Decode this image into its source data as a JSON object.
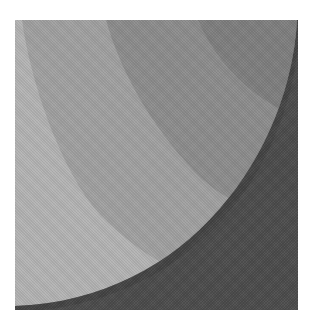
{
  "artwork": {
    "subject": "abstract concentric arcs",
    "colors": {
      "background": "#ffffff",
      "band_lightest": "#b3b3b3",
      "band_light": "#a0a0a0",
      "band_middle": "#8c8c8c",
      "band_inner": "#7e7e7e",
      "dark_region": "#4b4b4b"
    }
  }
}
